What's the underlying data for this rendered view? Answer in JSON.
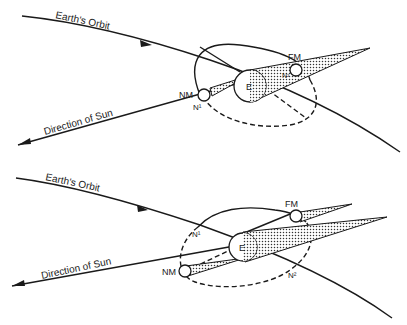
{
  "figure": {
    "panels": [
      {
        "id": "top",
        "labels": {
          "orbit": "Earth's Orbit",
          "sun_direction": "Direction of Sun",
          "earth": "E",
          "full_moon": "FM",
          "new_moon": "NM",
          "node1": "N¹",
          "node2": "N²"
        }
      },
      {
        "id": "bottom",
        "labels": {
          "orbit": "Earth's Orbit",
          "sun_direction": "Direction of Sun",
          "earth": "E",
          "full_moon": "FM",
          "new_moon": "NM",
          "node1": "N¹",
          "node2": "N²"
        }
      }
    ]
  },
  "colors": {
    "ink": "#1a1a1a",
    "paper": "#ffffff"
  }
}
